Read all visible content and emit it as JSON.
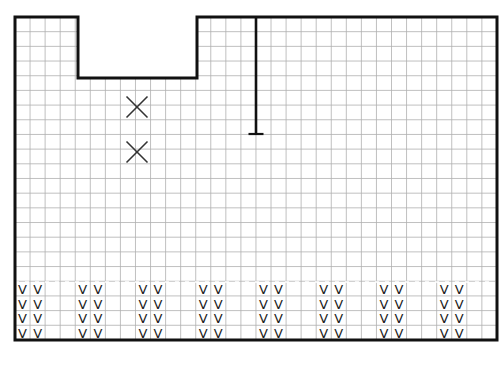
{
  "diagram": {
    "type": "floor-plan-grid",
    "grid": {
      "origin_x": 15,
      "origin_y": 17,
      "cols": 32,
      "rows": 22,
      "cell_w": 15.06,
      "cell_h": 14.68,
      "line_color": "#b0b0b0"
    },
    "outline_color": "#111111",
    "outline": [
      [
        15,
        17
      ],
      [
        78,
        17
      ],
      [
        78,
        78
      ],
      [
        197,
        78
      ],
      [
        197,
        17
      ],
      [
        497,
        17
      ],
      [
        497,
        340
      ],
      [
        15,
        340
      ]
    ],
    "cutout_fill": "#ffffff",
    "wall_t": {
      "x": 256,
      "y_top": 17,
      "y_bottom": 134,
      "foot_half": 7.5
    },
    "x_marks": [
      {
        "cx": 137,
        "cy": 107,
        "size": 10.5
      },
      {
        "cx": 137,
        "cy": 152,
        "size": 10.5
      }
    ],
    "dashed_line": {
      "y": 282
    },
    "v_glyph": "V",
    "v_pairs_start_cols": [
      0,
      4,
      8,
      12,
      16,
      20,
      24,
      28
    ],
    "v_rows": 4,
    "v_top_y": 282
  }
}
